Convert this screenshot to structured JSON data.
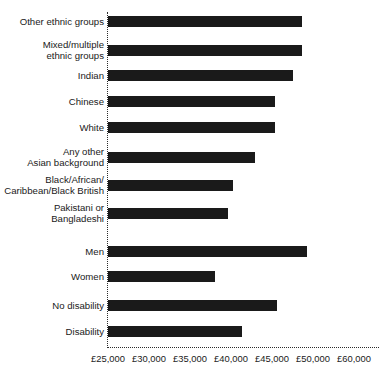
{
  "chart_data": {
    "type": "bar",
    "orientation": "horizontal",
    "title": "",
    "subtitle": "",
    "xlabel": "",
    "ylabel": "",
    "grid": false,
    "legend": null,
    "axis_origin_value": 25000,
    "xlim": [
      25000,
      58000
    ],
    "xticks": [
      25000,
      30000,
      35000,
      40000,
      45000,
      50000,
      60000
    ],
    "xticklabels": [
      "£25,000",
      "£30,000",
      "£35,000",
      "£40,000",
      "£45,000",
      "£50,000",
      "£60,000"
    ],
    "categories": [
      "Other ethnic groups",
      "Mixed/multiple ethnic groups",
      "Indian",
      "Chinese",
      "White",
      "Any other Asian background",
      "Black/African/ Caribbean/Black British",
      "Pakistani or Bangladeshi",
      "Men",
      "Women",
      "No disability",
      "Disability"
    ],
    "values": [
      48700,
      48700,
      47600,
      45400,
      45400,
      42900,
      40200,
      39600,
      49300,
      38000,
      45600,
      41300
    ],
    "groups": [
      {
        "name": "ethnicity",
        "categories": 8
      },
      {
        "name": "sex",
        "categories": 2
      },
      {
        "name": "disability",
        "categories": 2
      }
    ]
  },
  "rows": [
    {
      "label": "Other ethnic groups",
      "label_lines": 1,
      "value": 48700,
      "top": 16
    },
    {
      "label": "Mixed/multiple\nethnic groups",
      "label_lines": 2,
      "value": 48700,
      "top": 45
    },
    {
      "label": "Indian",
      "label_lines": 1,
      "value": 47600,
      "top": 70
    },
    {
      "label": "Chinese",
      "label_lines": 1,
      "value": 45400,
      "top": 96
    },
    {
      "label": "White",
      "label_lines": 1,
      "value": 45400,
      "top": 122
    },
    {
      "label": "Any other\nAsian background",
      "label_lines": 2,
      "value": 42900,
      "top": 152
    },
    {
      "label": "Black/African/\nCaribbean/Black British",
      "label_lines": 2,
      "value": 40200,
      "top": 180
    },
    {
      "label": "Pakistani or\nBangladeshi",
      "label_lines": 2,
      "value": 39600,
      "top": 208
    },
    {
      "label": "Men",
      "label_lines": 1,
      "value": 49300,
      "top": 246
    },
    {
      "label": "Women",
      "label_lines": 1,
      "value": 38000,
      "top": 271
    },
    {
      "label": "No disability",
      "label_lines": 1,
      "value": 45600,
      "top": 300
    },
    {
      "label": "Disability",
      "label_lines": 1,
      "value": 41300,
      "top": 326
    }
  ],
  "style": {
    "bar_color": "#1a1a1a",
    "axis_color": "#2b2b2b",
    "background": "#ffffff",
    "text_color": "#1a1a1a"
  }
}
